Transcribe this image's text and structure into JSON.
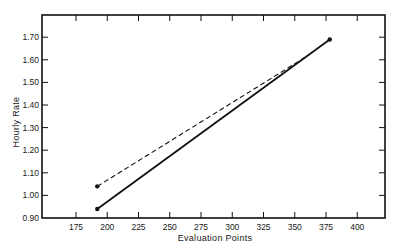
{
  "chart_data": {
    "type": "line",
    "title": "",
    "xlabel": "Evaluation Points",
    "ylabel": "Hourly Rate",
    "xlim": [
      148,
      422
    ],
    "ylim": [
      0.9,
      1.79
    ],
    "x_ticks": [
      175,
      200,
      225,
      250,
      275,
      300,
      325,
      350,
      375,
      400
    ],
    "x_tick_labels": [
      "175",
      "200",
      "225",
      "250",
      "275",
      "300",
      "325",
      "350",
      "375",
      "400"
    ],
    "y_ticks": [
      0.9,
      1.0,
      1.1,
      1.2,
      1.3,
      1.4,
      1.5,
      1.6,
      1.7
    ],
    "y_tick_labels": [
      "0.90",
      "1.00",
      "1.10",
      "1.20",
      "1.30",
      "1.40",
      "1.50",
      "1.60",
      "1.70"
    ],
    "grid": false,
    "legend": null,
    "series": [
      {
        "name": "solid line",
        "style": "solid",
        "color": "#111111",
        "x": [
          192,
          378
        ],
        "y": [
          0.94,
          1.69
        ]
      },
      {
        "name": "dashed line",
        "style": "dashed",
        "color": "#111111",
        "x": [
          192,
          358
        ],
        "y": [
          1.04,
          1.61
        ]
      }
    ]
  },
  "colors": {
    "ink": "#111111",
    "background": "#ffffff"
  }
}
